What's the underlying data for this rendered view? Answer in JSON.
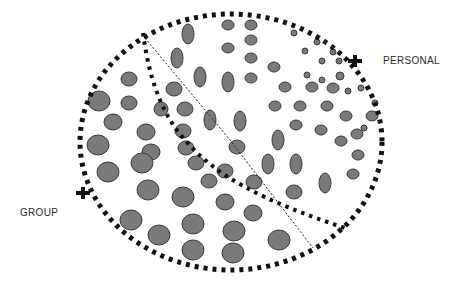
{
  "labels": {
    "personal": "PERSONAL",
    "group": "GROUP"
  },
  "colors": {
    "dot_fill": "#7a7a7a",
    "dot_stroke": "#3a3a3a",
    "border": "#111111",
    "background": "#ffffff"
  },
  "outer_boundary": {
    "cx": 231,
    "cy": 142,
    "rx": 151,
    "ry": 128
  },
  "markers": [
    {
      "name": "personal-marker",
      "x": 355,
      "y": 61
    },
    {
      "name": "group-marker",
      "x": 83,
      "y": 193
    }
  ],
  "ellipses": [
    {
      "cx": 188,
      "cy": 34,
      "rx": 6,
      "ry": 10
    },
    {
      "cx": 228,
      "cy": 25,
      "rx": 6,
      "ry": 5
    },
    {
      "cx": 251,
      "cy": 25,
      "rx": 6,
      "ry": 5
    },
    {
      "cx": 228,
      "cy": 48,
      "rx": 6,
      "ry": 5
    },
    {
      "cx": 251,
      "cy": 40,
      "rx": 6,
      "ry": 5
    },
    {
      "cx": 251,
      "cy": 58,
      "rx": 6,
      "ry": 5
    },
    {
      "cx": 251,
      "cy": 78,
      "rx": 6,
      "ry": 5
    },
    {
      "cx": 177,
      "cy": 58,
      "rx": 6,
      "ry": 10
    },
    {
      "cx": 200,
      "cy": 77,
      "rx": 6,
      "ry": 10
    },
    {
      "cx": 228,
      "cy": 82,
      "rx": 6,
      "ry": 10
    },
    {
      "cx": 274,
      "cy": 67,
      "rx": 6,
      "ry": 5
    },
    {
      "cx": 294,
      "cy": 33,
      "rx": 3,
      "ry": 3
    },
    {
      "cx": 305,
      "cy": 51,
      "rx": 3,
      "ry": 3
    },
    {
      "cx": 317,
      "cy": 42,
      "rx": 3,
      "ry": 3
    },
    {
      "cx": 322,
      "cy": 61,
      "rx": 3,
      "ry": 3
    },
    {
      "cx": 333,
      "cy": 52,
      "rx": 3,
      "ry": 3
    },
    {
      "cx": 307,
      "cy": 75,
      "rx": 3,
      "ry": 3
    },
    {
      "cx": 322,
      "cy": 80,
      "rx": 3,
      "ry": 3
    },
    {
      "cx": 339,
      "cy": 61,
      "rx": 3,
      "ry": 3
    },
    {
      "cx": 340,
      "cy": 76,
      "rx": 4,
      "ry": 4
    },
    {
      "cx": 361,
      "cy": 88,
      "rx": 3,
      "ry": 3
    },
    {
      "cx": 375,
      "cy": 103,
      "rx": 3,
      "ry": 3
    },
    {
      "cx": 364,
      "cy": 128,
      "rx": 3,
      "ry": 3
    },
    {
      "cx": 285,
      "cy": 87,
      "rx": 6,
      "ry": 5
    },
    {
      "cx": 312,
      "cy": 87,
      "rx": 6,
      "ry": 5
    },
    {
      "cx": 333,
      "cy": 88,
      "rx": 6,
      "ry": 5
    },
    {
      "cx": 348,
      "cy": 91,
      "rx": 3,
      "ry": 3
    },
    {
      "cx": 275,
      "cy": 106,
      "rx": 6,
      "ry": 5
    },
    {
      "cx": 300,
      "cy": 106,
      "rx": 6,
      "ry": 5
    },
    {
      "cx": 327,
      "cy": 106,
      "rx": 6,
      "ry": 5
    },
    {
      "cx": 346,
      "cy": 116,
      "rx": 6,
      "ry": 5
    },
    {
      "cx": 372,
      "cy": 116,
      "rx": 6,
      "ry": 5
    },
    {
      "cx": 296,
      "cy": 125,
      "rx": 6,
      "ry": 5
    },
    {
      "cx": 321,
      "cy": 130,
      "rx": 6,
      "ry": 5
    },
    {
      "cx": 357,
      "cy": 134,
      "rx": 6,
      "ry": 5
    },
    {
      "cx": 341,
      "cy": 141,
      "rx": 6,
      "ry": 5
    },
    {
      "cx": 358,
      "cy": 155,
      "rx": 6,
      "ry": 5
    },
    {
      "cx": 353,
      "cy": 174,
      "rx": 6,
      "ry": 5
    },
    {
      "cx": 210,
      "cy": 120,
      "rx": 6,
      "ry": 10
    },
    {
      "cx": 240,
      "cy": 121,
      "rx": 6,
      "ry": 10
    },
    {
      "cx": 278,
      "cy": 140,
      "rx": 6,
      "ry": 10
    },
    {
      "cx": 268,
      "cy": 164,
      "rx": 6,
      "ry": 10
    },
    {
      "cx": 296,
      "cy": 164,
      "rx": 6,
      "ry": 10
    },
    {
      "cx": 325,
      "cy": 183,
      "rx": 6,
      "ry": 10
    },
    {
      "cx": 294,
      "cy": 192,
      "rx": 8,
      "ry": 7
    },
    {
      "cx": 237,
      "cy": 147,
      "rx": 8,
      "ry": 7
    },
    {
      "cx": 225,
      "cy": 171,
      "rx": 8,
      "ry": 7
    },
    {
      "cx": 254,
      "cy": 182,
      "rx": 8,
      "ry": 7
    },
    {
      "cx": 209,
      "cy": 181,
      "rx": 8,
      "ry": 7
    },
    {
      "cx": 186,
      "cy": 148,
      "rx": 8,
      "ry": 7
    },
    {
      "cx": 183,
      "cy": 131,
      "rx": 8,
      "ry": 7
    },
    {
      "cx": 185,
      "cy": 109,
      "rx": 8,
      "ry": 7
    },
    {
      "cx": 174,
      "cy": 89,
      "rx": 8,
      "ry": 7
    },
    {
      "cx": 196,
      "cy": 163,
      "rx": 8,
      "ry": 7
    },
    {
      "cx": 161,
      "cy": 109,
      "rx": 7,
      "ry": 7
    },
    {
      "cx": 129,
      "cy": 79,
      "rx": 8,
      "ry": 7
    },
    {
      "cx": 129,
      "cy": 103,
      "rx": 8,
      "ry": 7
    },
    {
      "cx": 99,
      "cy": 101,
      "rx": 11,
      "ry": 10
    },
    {
      "cx": 113,
      "cy": 122,
      "rx": 9,
      "ry": 8
    },
    {
      "cx": 146,
      "cy": 132,
      "rx": 9,
      "ry": 8
    },
    {
      "cx": 98,
      "cy": 145,
      "rx": 11,
      "ry": 10
    },
    {
      "cx": 108,
      "cy": 172,
      "rx": 11,
      "ry": 10
    },
    {
      "cx": 151,
      "cy": 152,
      "rx": 9,
      "ry": 8
    },
    {
      "cx": 142,
      "cy": 163,
      "rx": 11,
      "ry": 10
    },
    {
      "cx": 148,
      "cy": 190,
      "rx": 11,
      "ry": 10
    },
    {
      "cx": 183,
      "cy": 197,
      "rx": 11,
      "ry": 10
    },
    {
      "cx": 225,
      "cy": 202,
      "rx": 9,
      "ry": 8
    },
    {
      "cx": 253,
      "cy": 213,
      "rx": 9,
      "ry": 8
    },
    {
      "cx": 131,
      "cy": 220,
      "rx": 11,
      "ry": 10
    },
    {
      "cx": 159,
      "cy": 235,
      "rx": 11,
      "ry": 10
    },
    {
      "cx": 193,
      "cy": 224,
      "rx": 11,
      "ry": 10
    },
    {
      "cx": 234,
      "cy": 231,
      "rx": 11,
      "ry": 10
    },
    {
      "cx": 193,
      "cy": 250,
      "rx": 11,
      "ry": 10
    },
    {
      "cx": 233,
      "cy": 253,
      "rx": 11,
      "ry": 10
    },
    {
      "cx": 279,
      "cy": 240,
      "rx": 11,
      "ry": 10
    }
  ]
}
